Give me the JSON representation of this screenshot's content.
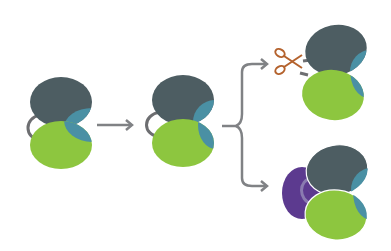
{
  "diagram": {
    "title": "",
    "colors": {
      "background": "#ffffff",
      "dark_domain": "#4d5d62",
      "green_domain": "#8dc63f",
      "teal_patch": "#4a90a4",
      "linker": "#6d6e71",
      "arrow": "#808285",
      "scissors": "#b4622d",
      "purple_domain": "#5c3a8f",
      "purple_ring": "#8a7bb0"
    },
    "stages": [
      {
        "id": "initial",
        "label": "",
        "description": "Two-domain molecule (dark top domain, green bottom domain) joined by a looped linker"
      },
      {
        "id": "intermediate",
        "label": "",
        "description": "Same two-domain molecule with linker loop"
      },
      {
        "id": "cleaved",
        "label": "",
        "description": "Linker cut by scissors; domains separate"
      },
      {
        "id": "bound",
        "label": "",
        "description": "Domains associated with a purple partner domain"
      }
    ],
    "connectors": [
      {
        "from": "initial",
        "to": "intermediate",
        "type": "arrow"
      },
      {
        "from": "intermediate",
        "to": [
          "cleaved",
          "bound"
        ],
        "type": "branching-brace"
      }
    ],
    "icons": [
      "scissors-icon"
    ]
  }
}
